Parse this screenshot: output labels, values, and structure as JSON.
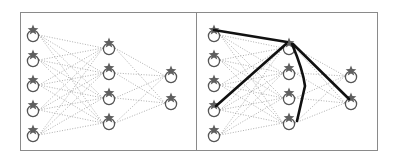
{
  "figure": {
    "colors": {
      "frame": "#8a8a8a",
      "dotted_edge": "#9a9a9a",
      "highlight_edge": "#111111",
      "node_ring": "#555555",
      "node_star": "#5f5f5f"
    },
    "icons": {
      "node": "star-over-circle-icon"
    },
    "panels": [
      {
        "id": "left",
        "frame": {
          "x": 20,
          "y": 12,
          "w": 176,
          "h": 138
        },
        "layers": [
          {
            "x": 33,
            "ys": [
              33,
              58,
              83,
              108,
              133
            ]
          },
          {
            "x": 109,
            "ys": [
              46,
              71,
              96,
              121
            ]
          },
          {
            "x": 171,
            "ys": [
              74,
              101
            ]
          }
        ],
        "highlight_paths": []
      },
      {
        "id": "right",
        "frame": {
          "x": 196,
          "y": 12,
          "w": 181,
          "h": 138
        },
        "layers": [
          {
            "x": 214,
            "ys": [
              33,
              58,
              83,
              108,
              133
            ]
          },
          {
            "x": 289,
            "ys": [
              46,
              71,
              96,
              121
            ]
          },
          {
            "x": 351,
            "ys": [
              74,
              101
            ]
          }
        ],
        "highlight_paths": [
          "M214 30 L287 42",
          "M216 106 L286 44",
          "M292 44 Q303 70 305 86 L297 121",
          "M293 44 L349 99"
        ]
      }
    ]
  }
}
